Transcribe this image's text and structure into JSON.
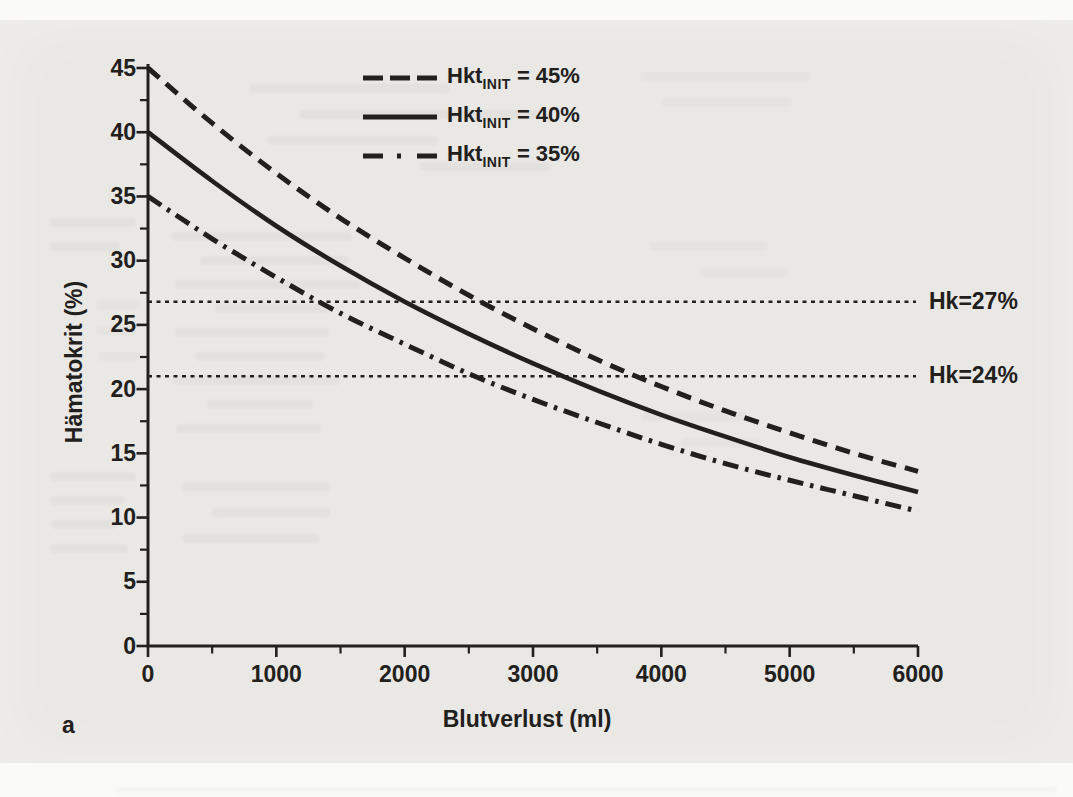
{
  "figure": {
    "panel_label": "a"
  },
  "colors": {
    "ink": "#22201c",
    "paper": "#e9e8e4",
    "page_margin": "#fafaf7"
  },
  "chart_data": {
    "type": "line",
    "title": "",
    "xlabel": "Blutverlust (ml)",
    "ylabel": "Hämatokrit (%)",
    "xlim": [
      0,
      6000
    ],
    "ylim": [
      0,
      45
    ],
    "x_major_tick_step": 1000,
    "x_minor_tick_step": 500,
    "y_major_tick_step": 5,
    "y_minor_tick_step": 2.5,
    "x_tick_labels": [
      "0",
      "1000",
      "2000",
      "3000",
      "4000",
      "5000",
      "6000"
    ],
    "y_tick_labels": [
      "0",
      "5",
      "10",
      "15",
      "20",
      "25",
      "30",
      "35",
      "40",
      "45"
    ],
    "grid": false,
    "legend_position": "inside-top-left",
    "x": [
      0,
      500,
      1000,
      1500,
      2000,
      2500,
      3000,
      3500,
      4000,
      4500,
      5000,
      5500,
      6000
    ],
    "series": [
      {
        "name": "Hkt_INIT = 45%",
        "line_style": "dashed",
        "values": [
          45.0,
          40.7,
          36.8,
          33.3,
          30.2,
          27.3,
          24.7,
          22.3,
          20.2,
          18.3,
          16.6,
          15.0,
          13.6
        ]
      },
      {
        "name": "Hkt_INIT = 40%",
        "line_style": "solid",
        "values": [
          40.0,
          36.2,
          32.7,
          29.6,
          26.8,
          24.3,
          22.0,
          19.9,
          18.0,
          16.3,
          14.7,
          13.3,
          12.0
        ]
      },
      {
        "name": "Hkt_INIT = 35%",
        "line_style": "dashdot",
        "values": [
          35.0,
          31.7,
          28.7,
          25.9,
          23.5,
          21.2,
          19.2,
          17.4,
          15.7,
          14.2,
          12.9,
          11.7,
          10.5
        ]
      }
    ],
    "legend": [
      {
        "line_style": "dashed",
        "label_main": "Hkt",
        "label_sub": "INIT",
        "label_rest": "= 45%"
      },
      {
        "line_style": "solid",
        "label_main": "Hkt",
        "label_sub": "INIT",
        "label_rest": "= 40%"
      },
      {
        "line_style": "dashdot",
        "label_main": "Hkt",
        "label_sub": "INIT",
        "label_rest": "= 35%"
      }
    ],
    "reference_lines": [
      {
        "label": "Hk=27%",
        "value": 27,
        "drawn_at_percent": 26.8
      },
      {
        "label": "Hk=24%",
        "value": 24,
        "drawn_at_percent": 21.0
      }
    ]
  }
}
